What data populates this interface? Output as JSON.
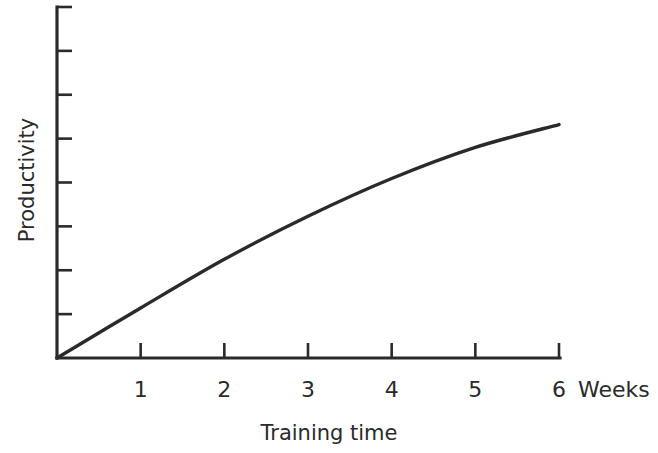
{
  "chart_data": {
    "type": "line",
    "title": "",
    "xlabel": "Training time",
    "ylabel": "Productivity",
    "x_unit_label": "Weeks",
    "x": [
      0,
      1,
      2,
      3,
      4,
      5,
      6
    ],
    "x_tick_labels": [
      "1",
      "2",
      "3",
      "4",
      "5",
      "6"
    ],
    "y_tick_count": 8,
    "y_tick_labels": [],
    "xlim": [
      0,
      6
    ],
    "ylim": [
      0,
      8
    ],
    "grid": false,
    "legend": null,
    "series": [
      {
        "name": "Productivity",
        "values": [
          0,
          1.14,
          2.25,
          3.23,
          4.09,
          4.8,
          5.32
        ]
      }
    ]
  },
  "axes": {
    "x_title": "Training time",
    "y_title": "Productivity",
    "x_unit": "Weeks"
  }
}
